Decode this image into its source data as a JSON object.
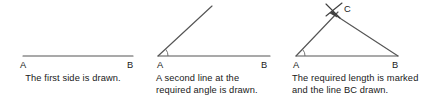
{
  "document": {
    "title": "Constructing a triangle given two sides and the included angle",
    "background_color": "#ffffff",
    "stroke_color": "#4a4a4a",
    "text_color": "#1a1a1a",
    "width": 437,
    "height": 110
  },
  "panels": [
    {
      "id": "panel-1",
      "step": 1,
      "caption": "The first side is drawn.",
      "caption_lines": [
        "The first side is drawn."
      ],
      "vertex_labels": [
        {
          "name": "A",
          "text": "A",
          "x": 20,
          "y": 60
        },
        {
          "name": "B",
          "text": "B",
          "x": 127,
          "y": 60
        }
      ],
      "geometry": {
        "type": "segment",
        "segments": [
          {
            "name": "side-AB",
            "x1": 23,
            "y1": 56,
            "x2": 133,
            "y2": 56
          }
        ],
        "arcs": [],
        "marks": []
      }
    },
    {
      "id": "panel-2",
      "step": 2,
      "caption": "A second line at the required angle is drawn.",
      "caption_lines": [
        "A second line at the",
        "required angle is drawn."
      ],
      "vertex_labels": [
        {
          "name": "A",
          "text": "A",
          "x": 11,
          "y": 60
        },
        {
          "name": "B",
          "text": "B",
          "x": 115,
          "y": 60
        }
      ],
      "geometry": {
        "type": "angle",
        "segments": [
          {
            "name": "side-AB",
            "x1": 12,
            "y1": 56,
            "x2": 124,
            "y2": 56
          },
          {
            "name": "ray-from-A",
            "x1": 12,
            "y1": 56,
            "x2": 66,
            "y2": 6
          }
        ],
        "arcs": [
          {
            "name": "angle-arc-at-A",
            "cx": 12,
            "cy": 56,
            "r": 10,
            "start_deg": 0,
            "end_deg": 43
          }
        ],
        "marks": []
      }
    },
    {
      "id": "panel-3",
      "step": 3,
      "caption": "The required length is marked and the line BC drawn.",
      "caption_lines": [
        "The required length is marked",
        "and the line BC drawn."
      ],
      "vertex_labels": [
        {
          "name": "A",
          "text": "A",
          "x": 5,
          "y": 60
        },
        {
          "name": "B",
          "text": "B",
          "x": 104,
          "y": 60
        },
        {
          "name": "C",
          "text": "C",
          "x": 54,
          "y": 4
        }
      ],
      "geometry": {
        "type": "triangle",
        "segments": [
          {
            "name": "side-AB",
            "x1": 8,
            "y1": 56,
            "x2": 110,
            "y2": 56
          },
          {
            "name": "side-AC",
            "x1": 8,
            "y1": 56,
            "x2": 50,
            "y2": 12
          },
          {
            "name": "side-BC",
            "x1": 45,
            "y1": 14,
            "x2": 110,
            "y2": 56
          }
        ],
        "arcs": [
          {
            "name": "angle-arc-at-A",
            "cx": 8,
            "cy": 56,
            "r": 9,
            "start_deg": 0,
            "end_deg": 46
          }
        ],
        "marks": [
          {
            "name": "cross-mark-at-C",
            "type": "cross",
            "cx": 45,
            "cy": 11,
            "size": 9,
            "angle_deg": 20
          },
          {
            "name": "arrow-head-at-C",
            "type": "arrowhead",
            "x": 48,
            "y": 17
          }
        ]
      }
    }
  ]
}
